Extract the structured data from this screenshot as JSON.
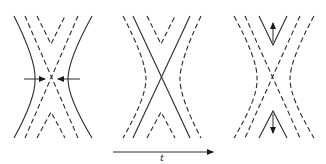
{
  "figure": {
    "panels": [
      {
        "id": "panel-1",
        "stage": "inflow",
        "arrows": "horizontal inflow arrows converging on X-point",
        "solid": "outer hyperbolic field lines",
        "dashed": "crossing separatrix lines and inner field lines"
      },
      {
        "id": "panel-2",
        "stage": "reconnection",
        "arrows": "none",
        "solid": "crossing separatrix lines (X)",
        "dashed": "outer and inner field lines"
      },
      {
        "id": "panel-3",
        "stage": "outflow",
        "arrows": "vertical outflow arrows away from X-point",
        "solid": "reconnected inner V-shaped field lines",
        "dashed": "outer field lines and separatrix lines"
      }
    ],
    "time_axis": {
      "label": "t",
      "direction": "right"
    },
    "colors": {
      "line": "#2a2a2a",
      "background": "#ffffff"
    }
  }
}
